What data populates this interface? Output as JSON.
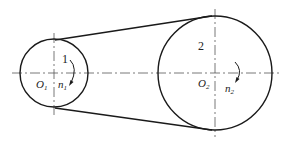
{
  "diagram": {
    "type": "belt-drive",
    "pulley_small": {
      "label": "1",
      "center_label": "O",
      "center_sub": "1",
      "speed_label": "n",
      "speed_sub": "1",
      "cx": 54,
      "cy": 73,
      "r": 34
    },
    "pulley_large": {
      "label": "2",
      "center_label": "O",
      "center_sub": "2",
      "speed_label": "n",
      "speed_sub": "2",
      "cx": 215,
      "cy": 73,
      "r": 57
    },
    "colors": {
      "line": "#1a1a1a",
      "centerline": "#555555",
      "background": "#ffffff"
    }
  }
}
